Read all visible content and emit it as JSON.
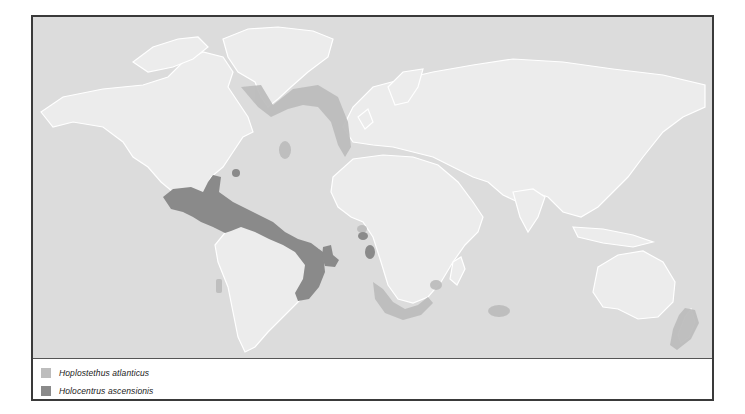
{
  "map": {
    "colors": {
      "ocean": "#dcdcdc",
      "land": "#ececec",
      "coast": "#ffffff",
      "hoplostethus": "#bdbdbd",
      "holocentrus": "#8a8a8a",
      "frame": "#3a3a3a"
    }
  },
  "legend": {
    "items": [
      {
        "label": "Hoplostethus atlanticus",
        "color": "#bdbdbd"
      },
      {
        "label": "Holocentrus ascensionis",
        "color": "#8a8a8a"
      }
    ]
  }
}
